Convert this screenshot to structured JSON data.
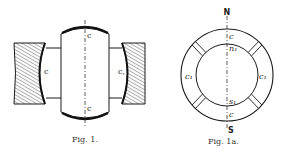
{
  "figures": [
    {
      "id": "fig1",
      "caption": "Fig. 1.",
      "labels": {
        "top_c": "c",
        "bottom_c": "c",
        "left_c": "c",
        "right_c": "c,"
      }
    },
    {
      "id": "fig1a",
      "caption": "Fig. 1a.",
      "labels": {
        "north": "N",
        "south": "S",
        "top_c": "c",
        "bottom_c": "c",
        "left_c1": "c₁",
        "right_c1": "c₁",
        "n1": "n₁",
        "s1": "s₁"
      }
    }
  ],
  "colors": {
    "ink": "#1a1a1a",
    "paper": "#ffffff"
  }
}
